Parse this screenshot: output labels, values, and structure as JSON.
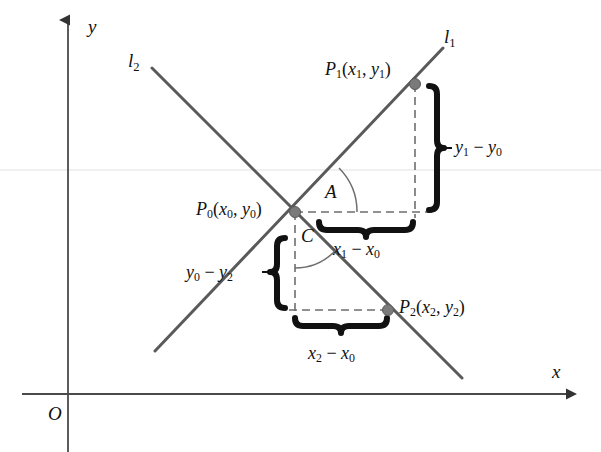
{
  "figure": {
    "background_color": "#ffffff",
    "line_color": "#5a5a5a",
    "axis_color": "#4a4a4a",
    "dash_color": "#6e6e6e",
    "brace_color": "#111111",
    "text_color": "#111111",
    "point_color": "#7a7a7a"
  },
  "axes": {
    "x_label": "x",
    "y_label": "y",
    "origin_label": "O"
  },
  "lines": [
    {
      "name": "l1",
      "label_plain": "l",
      "label_sub": "1"
    },
    {
      "name": "l2",
      "label_plain": "l",
      "label_sub": "2"
    }
  ],
  "points": [
    {
      "name": "P0",
      "label_p": "P",
      "label_p_sub": "0",
      "coords_open": "(",
      "coord_x": "x",
      "coord_x_sub": "0",
      "comma": ", ",
      "coord_y": "y",
      "coord_y_sub": "0",
      "coords_close": ")"
    },
    {
      "name": "P1",
      "label_p": "P",
      "label_p_sub": "1",
      "coords_open": "(",
      "coord_x": "x",
      "coord_x_sub": "1",
      "comma": ", ",
      "coord_y": "y",
      "coord_y_sub": "1",
      "coords_close": ")"
    },
    {
      "name": "P2",
      "label_p": "P",
      "label_p_sub": "2",
      "coords_open": "(",
      "coord_x": "x",
      "coord_x_sub": "2",
      "comma": ", ",
      "coord_y": "y",
      "coord_y_sub": "2",
      "coords_close": ")"
    }
  ],
  "angles": [
    {
      "name": "A",
      "label": "A"
    },
    {
      "name": "C",
      "label": "C"
    }
  ],
  "segments": [
    {
      "name": "rise-1",
      "term1": "y",
      "term1_sub": "1",
      "operator": " − ",
      "term2": "y",
      "term2_sub": "0"
    },
    {
      "name": "run-1",
      "term1": "x",
      "term1_sub": "1",
      "operator": " − ",
      "term2": "x",
      "term2_sub": "0"
    },
    {
      "name": "rise-2",
      "term1": "y",
      "term1_sub": "0",
      "operator": " − ",
      "term2": "y",
      "term2_sub": "2"
    },
    {
      "name": "run-2",
      "term1": "x",
      "term1_sub": "2",
      "operator": " − ",
      "term2": "x",
      "term2_sub": "0"
    }
  ]
}
